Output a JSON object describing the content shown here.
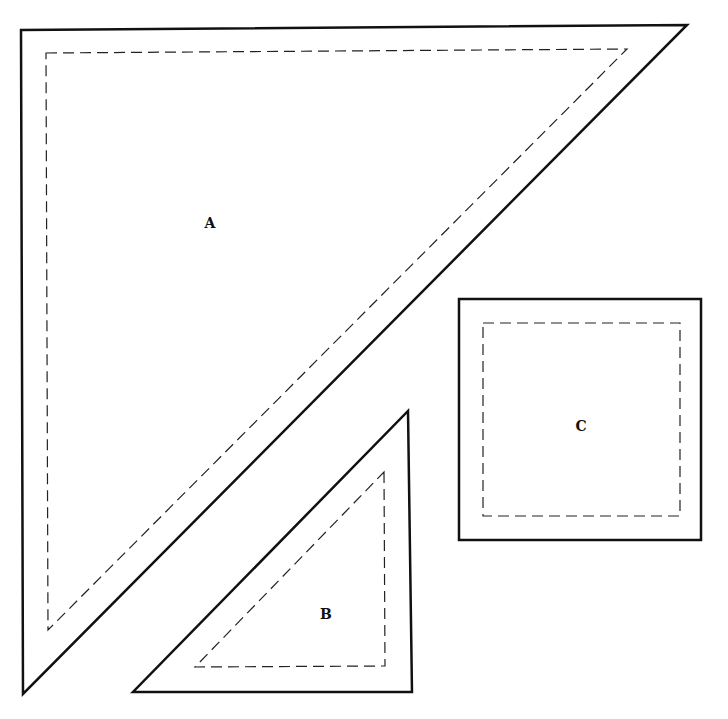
{
  "diagram": {
    "pieces": [
      {
        "id": "A",
        "label": "A",
        "shape": "right-triangle",
        "outer": [
          [
            21,
            30
          ],
          [
            687,
            25
          ],
          [
            23,
            694
          ]
        ],
        "seam": [
          [
            46,
            53
          ],
          [
            627,
            49
          ],
          [
            48,
            630
          ]
        ],
        "label_pos": [
          210,
          227
        ]
      },
      {
        "id": "B",
        "label": "B",
        "shape": "right-triangle",
        "outer": [
          [
            408,
            411
          ],
          [
            412,
            692
          ],
          [
            133,
            692
          ]
        ],
        "seam": [
          [
            384,
            472
          ],
          [
            385,
            666
          ],
          [
            195,
            667
          ]
        ],
        "label_pos": [
          326,
          618
        ]
      },
      {
        "id": "C",
        "label": "C",
        "shape": "square",
        "outer": [
          [
            459,
            299
          ],
          [
            701,
            299
          ],
          [
            701,
            540
          ],
          [
            459,
            540
          ]
        ],
        "seam": [
          [
            483,
            323
          ],
          [
            680,
            323
          ],
          [
            680,
            516
          ],
          [
            483,
            516
          ]
        ],
        "label_pos": [
          581,
          430
        ]
      }
    ],
    "line_styles": {
      "cut_line": "solid",
      "seam_line": "dashed"
    }
  }
}
